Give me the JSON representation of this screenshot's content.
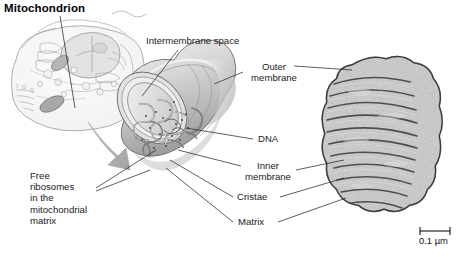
{
  "figure": {
    "title": "Mitochondrion",
    "background_color": "#ffffff",
    "ink_color": "#1a1a1a"
  },
  "labels": {
    "intermembrane_space": "Intermembrane space",
    "outer_membrane_line1": "Outer",
    "outer_membrane_line2": "membrane",
    "dna": "DNA",
    "inner_membrane_line1": "Inner",
    "inner_membrane_line2": "membrane",
    "cristae": "Cristae",
    "matrix": "Matrix",
    "free_ribosomes_line1": "Free",
    "free_ribosomes_line2": "ribosomes",
    "free_ribosomes_line3": "in the",
    "free_ribosomes_line4": "mitochondrial",
    "free_ribosomes_line5": "matrix"
  },
  "scale_bar": {
    "label": "0.1 µm"
  },
  "panels": {
    "cell_inset_name": "eukaryotic-cell-inset",
    "diagram_name": "mitochondrion-cutaway-diagram",
    "micrograph_name": "mitochondrion-electron-micrograph"
  },
  "colors": {
    "organelle_light": "#e8e8e8",
    "organelle_mid": "#c9c9c9",
    "organelle_dark": "#9e9e9e",
    "outline": "#6e6e6e",
    "arrow": "#b0b0b0",
    "micrograph_dark": "#5a5a5a",
    "micrograph_light": "#d2d2d2"
  }
}
